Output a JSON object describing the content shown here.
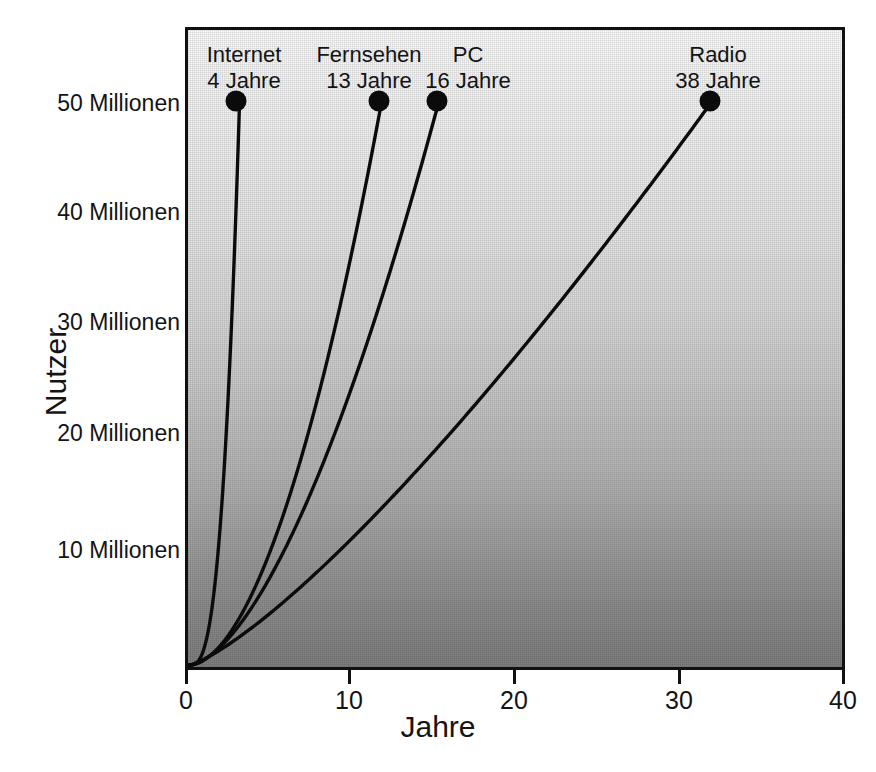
{
  "chart_data": {
    "type": "line",
    "title": "",
    "subtitle": "",
    "xlabel": "Jahre",
    "ylabel": "Nutzer",
    "xlim": [
      0,
      42
    ],
    "ylim": [
      0,
      55
    ],
    "grid": false,
    "legend_position": "inline-annotations",
    "xticks": [
      {
        "value": 0,
        "label": "0"
      },
      {
        "value": 10,
        "label": "10"
      },
      {
        "value": 20,
        "label": "20"
      },
      {
        "value": 30,
        "label": "30"
      },
      {
        "value": 40,
        "label": "40"
      }
    ],
    "yticks": [
      {
        "value": 10,
        "label": "10 Millionen"
      },
      {
        "value": 20,
        "label": "20 Millionen"
      },
      {
        "value": 30,
        "label": "30 Millionen"
      },
      {
        "value": 40,
        "label": "40 Millionen"
      },
      {
        "value": 50,
        "label": "50 Millionen"
      }
    ],
    "note": "Jahre bis 50 Millionen Nutzer erreicht werden",
    "series": [
      {
        "name": "Internet",
        "years_label": "4 Jahre",
        "years_to_50m": 4,
        "endpoint": {
          "x": 3.1,
          "y": 50
        },
        "curve_exponent": 2.9,
        "color": "#0b0b0b"
      },
      {
        "name": "Fernsehen",
        "years_label": "13 Jahre",
        "years_to_50m": 13,
        "endpoint": {
          "x": 11.8,
          "y": 50
        },
        "curve_exponent": 1.85,
        "color": "#0b0b0b"
      },
      {
        "name": "PC",
        "years_label": "16 Jahre",
        "years_to_50m": 16,
        "endpoint": {
          "x": 15.3,
          "y": 50
        },
        "curve_exponent": 1.65,
        "color": "#0b0b0b"
      },
      {
        "name": "Radio",
        "years_label": "38 Jahre",
        "years_to_50m": 38,
        "endpoint": {
          "x": 32.0,
          "y": 50
        },
        "curve_exponent": 1.28,
        "color": "#0b0b0b"
      }
    ]
  },
  "axes": {
    "x_title": "Jahre",
    "y_title": "Nutzer"
  },
  "style": {
    "frame_color": "#111111",
    "line_color": "#0b0b0b",
    "background_top": "#fdfdfd",
    "background_bottom": "#808080",
    "text_color": "#141414"
  }
}
